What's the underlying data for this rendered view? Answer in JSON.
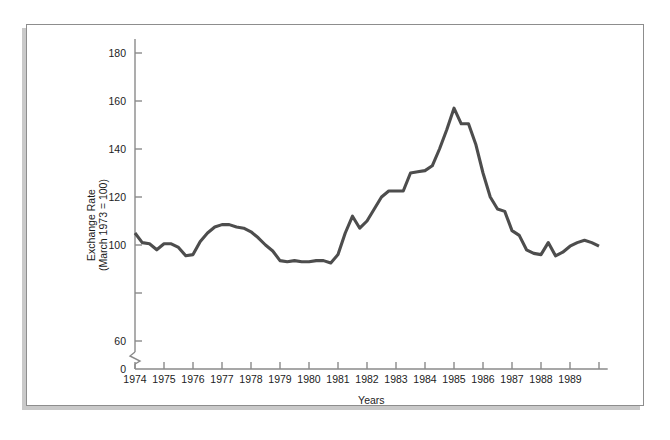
{
  "figure": {
    "background_color": "#ffffff",
    "panel_border_color": "#8d8d8d",
    "shadow_color": "#c9c9c9"
  },
  "chart_data": {
    "type": "line",
    "title": "",
    "xlabel": "Years",
    "ylabel": "Exchange Rate\n(March 1973 = 100)",
    "ylabel_line1": "Exchange Rate",
    "ylabel_line2": "(March 1973 = 100)",
    "line_color": "#4d4d4d",
    "axis_color": "#8a8a8a",
    "grid": false,
    "legend": null,
    "axis_break": {
      "present": true,
      "between": [
        0,
        60
      ],
      "style": "zigzag"
    },
    "ylim": [
      0,
      190
    ],
    "yticks": [
      0,
      60,
      80,
      100,
      120,
      140,
      160,
      180
    ],
    "ytick_labels": [
      "0",
      "60",
      "",
      "100",
      "120",
      "140",
      "160",
      "180"
    ],
    "xlim": [
      1974,
      1990.3
    ],
    "xticks": [
      1974,
      1975,
      1976,
      1977,
      1978,
      1979,
      1980,
      1981,
      1982,
      1983,
      1984,
      1985,
      1986,
      1987,
      1988,
      1989,
      1990
    ],
    "xtick_labels": [
      "1974",
      "1975",
      "1976",
      "1977",
      "1978",
      "1979",
      "1980",
      "1981",
      "1982",
      "1983",
      "1984",
      "1985",
      "1986",
      "1987",
      "1988",
      "1989",
      ""
    ],
    "x": [
      1974.0,
      1974.25,
      1974.5,
      1974.75,
      1975.0,
      1975.25,
      1975.5,
      1975.75,
      1976.0,
      1976.25,
      1976.5,
      1976.75,
      1977.0,
      1977.25,
      1977.5,
      1977.75,
      1978.0,
      1978.25,
      1978.5,
      1978.75,
      1979.0,
      1979.25,
      1979.5,
      1979.75,
      1980.0,
      1980.25,
      1980.5,
      1980.75,
      1981.0,
      1981.25,
      1981.5,
      1981.75,
      1982.0,
      1982.25,
      1982.5,
      1982.75,
      1983.0,
      1983.25,
      1983.5,
      1983.75,
      1984.0,
      1984.25,
      1984.5,
      1984.75,
      1985.0,
      1985.25,
      1985.5,
      1985.75,
      1986.0,
      1986.25,
      1986.5,
      1986.75,
      1987.0,
      1987.25,
      1987.5,
      1987.75,
      1988.0,
      1988.25,
      1988.5,
      1988.75,
      1989.0,
      1989.25,
      1989.5,
      1989.75,
      1990.0
    ],
    "values": [
      105.0,
      101.0,
      100.5,
      98.0,
      100.5,
      100.5,
      99.0,
      95.5,
      96.0,
      101.5,
      105.0,
      107.5,
      108.5,
      108.5,
      107.5,
      107.0,
      105.5,
      103.0,
      100.0,
      97.5,
      93.5,
      93.0,
      93.5,
      93.0,
      93.0,
      93.5,
      93.5,
      92.5,
      96.0,
      105.0,
      112.0,
      107.0,
      110.0,
      115.0,
      120.0,
      122.5,
      122.5,
      122.5,
      130.0,
      130.5,
      131.0,
      133.0,
      140.0,
      148.0,
      157.0,
      150.5,
      150.5,
      142.0,
      130.0,
      120.0,
      115.0,
      114.0,
      106.0,
      104.0,
      98.0,
      96.5,
      96.0,
      101.0,
      95.5,
      97.0,
      99.5,
      101.0,
      102.0,
      101.0,
      99.5
    ],
    "series": [
      {
        "name": "Exchange Rate",
        "color": "#4d4d4d"
      }
    ]
  }
}
